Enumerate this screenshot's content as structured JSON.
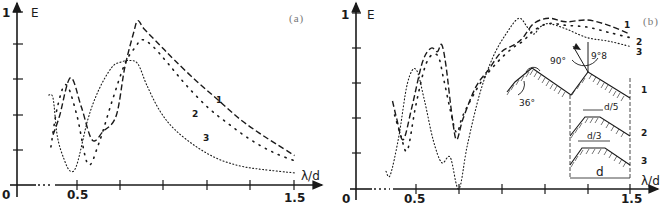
{
  "chart_data": [
    {
      "panel": "(a)",
      "type": "line",
      "title": "",
      "xlabel": "λ/d",
      "ylabel": "E",
      "xlim": [
        0,
        1.5
      ],
      "ylim": [
        0,
        1
      ],
      "x_ticks": [
        0.5,
        0.7,
        0.9,
        1.1,
        1.3,
        1.5
      ],
      "x_tick_labels": [
        "0",
        "0.5",
        "1.5"
      ],
      "y_ticks": [
        0.2,
        0.4,
        0.6,
        0.8,
        1.0
      ],
      "y_tick_labels": [
        "0",
        "1"
      ],
      "grid": false,
      "legend": "inline curve numbers 1, 2, 3",
      "series": [
        {
          "name": "1",
          "style": "dashed",
          "x": [
            0.39,
            0.42,
            0.47,
            0.52,
            0.57,
            0.62,
            0.68,
            0.72,
            0.76,
            0.78,
            0.81,
            0.88,
            0.95,
            1.05,
            1.15,
            1.25,
            1.35,
            1.45,
            1.5
          ],
          "y": [
            0.29,
            0.4,
            0.62,
            0.45,
            0.26,
            0.31,
            0.4,
            0.68,
            0.88,
            0.95,
            0.9,
            0.81,
            0.72,
            0.6,
            0.49,
            0.38,
            0.29,
            0.21,
            0.17
          ]
        },
        {
          "name": "2",
          "style": "coarse-dotted",
          "x": [
            0.38,
            0.41,
            0.45,
            0.5,
            0.55,
            0.6,
            0.66,
            0.72,
            0.77,
            0.8,
            0.85,
            0.92,
            1.0,
            1.1,
            1.2,
            1.3,
            1.4,
            1.5
          ],
          "y": [
            0.22,
            0.45,
            0.58,
            0.4,
            0.12,
            0.24,
            0.48,
            0.7,
            0.8,
            0.84,
            0.8,
            0.7,
            0.58,
            0.45,
            0.35,
            0.26,
            0.19,
            0.14
          ]
        },
        {
          "name": "3",
          "style": "fine-dotted",
          "x": [
            0.37,
            0.39,
            0.41,
            0.44,
            0.47,
            0.5,
            0.55,
            0.6,
            0.66,
            0.7,
            0.74,
            0.78,
            0.82,
            0.88,
            0.95,
            1.05,
            1.15,
            1.25,
            1.35,
            1.5
          ],
          "y": [
            0.52,
            0.5,
            0.28,
            0.15,
            0.08,
            0.12,
            0.38,
            0.55,
            0.68,
            0.71,
            0.72,
            0.7,
            0.58,
            0.43,
            0.32,
            0.22,
            0.15,
            0.11,
            0.09,
            0.07
          ]
        }
      ]
    },
    {
      "panel": "(b)",
      "type": "line",
      "title": "",
      "xlabel": "λ/d",
      "ylabel": "E",
      "xlim": [
        0,
        1.5
      ],
      "ylim": [
        0,
        1
      ],
      "x_ticks": [
        0.5,
        0.7,
        0.9,
        1.1,
        1.3,
        1.5
      ],
      "x_tick_labels": [
        "0",
        "0.5",
        "1.5"
      ],
      "y_ticks": [
        0.2,
        0.4,
        0.6,
        0.8,
        1.0
      ],
      "y_tick_labels": [
        "0",
        "1"
      ],
      "grid": false,
      "legend": "inline curve numbers 1, 2, 3",
      "series": [
        {
          "name": "1",
          "style": "dashed",
          "x": [
            0.39,
            0.41,
            0.44,
            0.48,
            0.53,
            0.57,
            0.6,
            0.62,
            0.64,
            0.67,
            0.69,
            0.72,
            0.78,
            0.84,
            0.9,
            0.96,
            1.0,
            1.05,
            1.12,
            1.2,
            1.3,
            1.4,
            1.5
          ],
          "y": [
            0.5,
            0.4,
            0.28,
            0.46,
            0.72,
            0.8,
            0.78,
            0.82,
            0.7,
            0.4,
            0.28,
            0.4,
            0.58,
            0.68,
            0.78,
            0.82,
            0.86,
            0.94,
            0.97,
            0.95,
            0.96,
            0.93,
            0.88
          ]
        },
        {
          "name": "2",
          "style": "coarse-dotted",
          "x": [
            0.4,
            0.43,
            0.46,
            0.5,
            0.55,
            0.6,
            0.63,
            0.66,
            0.69,
            0.72,
            0.8,
            0.88,
            0.95,
            1.0,
            1.05,
            1.12,
            1.2,
            1.3,
            1.4,
            1.5
          ],
          "y": [
            0.42,
            0.3,
            0.22,
            0.48,
            0.72,
            0.76,
            0.62,
            0.45,
            0.32,
            0.42,
            0.6,
            0.72,
            0.8,
            0.84,
            0.9,
            0.94,
            0.93,
            0.92,
            0.89,
            0.86
          ]
        },
        {
          "name": "3",
          "style": "fine-dotted",
          "x": [
            0.36,
            0.38,
            0.42,
            0.46,
            0.5,
            0.54,
            0.58,
            0.62,
            0.66,
            0.7,
            0.74,
            0.8,
            0.86,
            0.92,
            0.98,
            1.02,
            1.05,
            1.08,
            1.12,
            1.2,
            1.3,
            1.4,
            1.5
          ],
          "y": [
            0.1,
            0.08,
            0.3,
            0.6,
            0.68,
            0.5,
            0.28,
            0.15,
            0.18,
            0.0,
            0.25,
            0.55,
            0.75,
            0.88,
            0.97,
            0.92,
            0.88,
            0.92,
            0.94,
            0.91,
            0.86,
            0.84,
            0.81
          ]
        }
      ],
      "inset": {
        "description": "Grating groove profiles 1, 2, 3",
        "labels": [
          "90°",
          "9°8",
          "36°",
          "d/5",
          "d/3",
          "d",
          "1",
          "2",
          "3"
        ]
      }
    }
  ],
  "text": {
    "panel_a": {
      "label": "(a)",
      "y_axis": "E",
      "y_one": "1",
      "origin": "0",
      "x_05": "0.5",
      "x_15": "1.5",
      "x_axis": "λ/d",
      "curve1": "1",
      "curve2": "2",
      "curve3": "3"
    },
    "panel_b": {
      "label": "(b)",
      "y_axis": "E",
      "y_one": "1",
      "origin": "0",
      "x_05": "0.5",
      "x_15": "1.5",
      "x_axis": "λ/d",
      "curve1": "1",
      "curve2": "2",
      "curve3": "3",
      "inset_angle_90": "90°",
      "inset_angle_98": "9°8",
      "inset_angle_36": "36°",
      "inset_d5": "d/5",
      "inset_d3": "d/3",
      "inset_d": "d",
      "profile1": "1",
      "profile2": "2",
      "profile3": "3"
    }
  }
}
